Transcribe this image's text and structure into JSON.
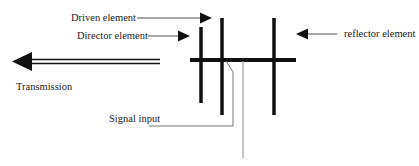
{
  "diagram": {
    "type": "yagi-antenna",
    "labels": {
      "driven": "Driven element",
      "director": "Director element",
      "reflector": "reflector element",
      "transmission": "Transmission",
      "signal_input": "Signal input"
    },
    "colors": {
      "stroke": "#111111",
      "feed_line": "#777777",
      "background": "#ffffff"
    }
  }
}
